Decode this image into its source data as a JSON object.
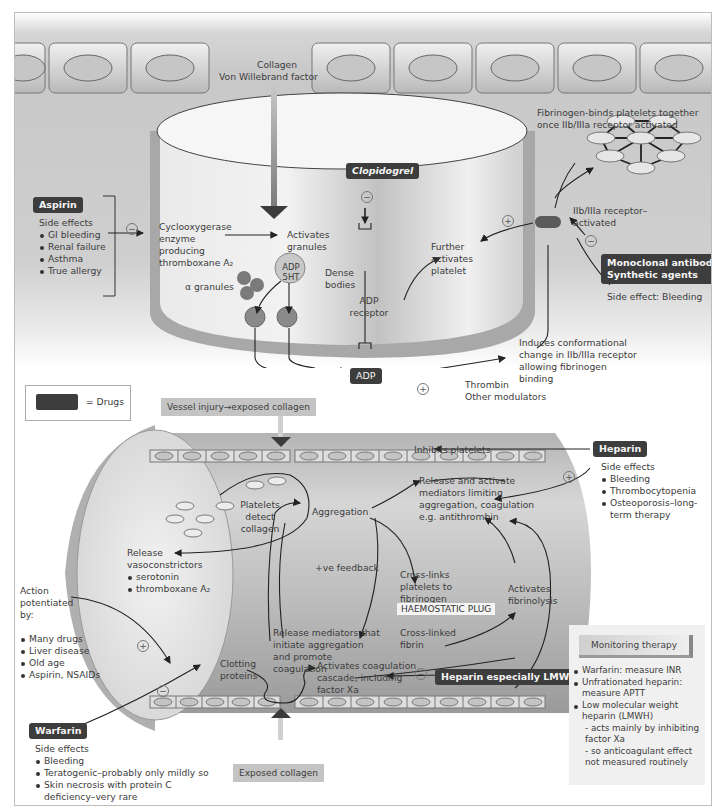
{
  "top_panel": {
    "collagen_label": "Collagen",
    "vwf_label": "Von Willebrand factor",
    "fibrinogen_note": "Fibrinogen-binds platelets together once IIb/IIIa receptor activated",
    "aspirin": {
      "drug": "Aspirin",
      "side_effects_title": "Side effects",
      "side_effects": [
        "GI bleeding",
        "Renal failure",
        "Asthma",
        "True allergy"
      ],
      "effect": "−"
    },
    "cyclooxygenase": "Cyclooxygerase enzyme producing thromboxane A₂",
    "activates_granules": "Activates granules",
    "alpha_granules": "α granules",
    "dense_body_content": "ADP 5HT",
    "dense_bodies": "Dense bodies",
    "clopidogrel": {
      "drug": "Clopidogrel",
      "effect": "−"
    },
    "adp_receptor": "ADP receptor",
    "adp": "ADP",
    "further_activates": "Further activates platelet",
    "further_effect": "+",
    "receptor_label": "IIb/IIIa receptor–activated",
    "monoclonal": {
      "drug_line1": "Monoclonal antibodies",
      "drug_line2": "Synthetic agents",
      "side_effect": "Side effect: Bleeding",
      "effect": "−"
    },
    "conformational": "Induces conformational change in IIb/IIIa receptor allowing fibrinogen binding",
    "modulators_effect": "+",
    "thrombin": "Thrombin",
    "other_modulators": "Other modulators"
  },
  "legend": {
    "label": "= Drugs"
  },
  "bottom_panel": {
    "vessel_injury": "Vessel injury→exposed collagen",
    "inhibit_platelets": "Inhibits platelets",
    "heparin": {
      "drug": "Heparin",
      "side_effects_title": "Side effects",
      "side_effects": [
        "Bleeding",
        "Thrombocytopenia",
        "Osteoporosis–long-term therapy"
      ],
      "effect": "+"
    },
    "platelets_detect": "Platelets detect collagen",
    "aggregation": "Aggregation",
    "release_activate": "Release and activate mediators limiting aggregation, coagulation e.g. antithrombin",
    "release_vaso": "Release vasoconstrictors",
    "vaso_items": [
      "serotonin",
      "thromboxane A₂"
    ],
    "ve_feedback": "+ve feedback",
    "crosslinks": "Cross-links platelets to fibrinogen",
    "haemostatic_plug": "HAEMOSTATIC PLUG",
    "crosslinked_fibrin": "Cross-linked fibrin",
    "activates_fibrinolysis": "Activates fibrinolysis",
    "release_mediators": "Release mediators that initiate aggregation and promote coagulation",
    "action_potentiated": "Action potentiated by:",
    "potentiators": [
      "Many drugs",
      "Liver disease",
      "Old age",
      "Aspirin, NSAIDs"
    ],
    "potentiate_effect": "+",
    "clotting_proteins": "Clotting proteins",
    "activates_cascade": "Activates coagulation cascade, including factor Xa",
    "heparin_lmwh": {
      "drug": "Heparin especially LMWH",
      "effect": "−"
    },
    "warfarin": {
      "drug": "Warfarin",
      "side_effects_title": "Side effects",
      "side_effects": [
        "Bleeding",
        "Teratogenic–probably only mildly so",
        "Skin necrosis with protein C deficiency–very rare"
      ],
      "effect": "−"
    },
    "exposed_collagen": "Exposed collagen",
    "monitoring": {
      "title": "Monitoring therapy",
      "items": [
        "Warfarin: measure INR",
        "Unfrationated heparin: measure APTT",
        "Low molecular weight heparin (LMWH)"
      ],
      "sub_items": [
        "- acts mainly by inhibiting factor Xa",
        "- so anticoagulant effect not measured routinely"
      ]
    }
  },
  "colors": {
    "drug_box": "#3d3d3d",
    "panel_bg": "#c9c9c9",
    "vessel_wall": "#a8a8a8",
    "label_box": "#c4c4c4"
  }
}
